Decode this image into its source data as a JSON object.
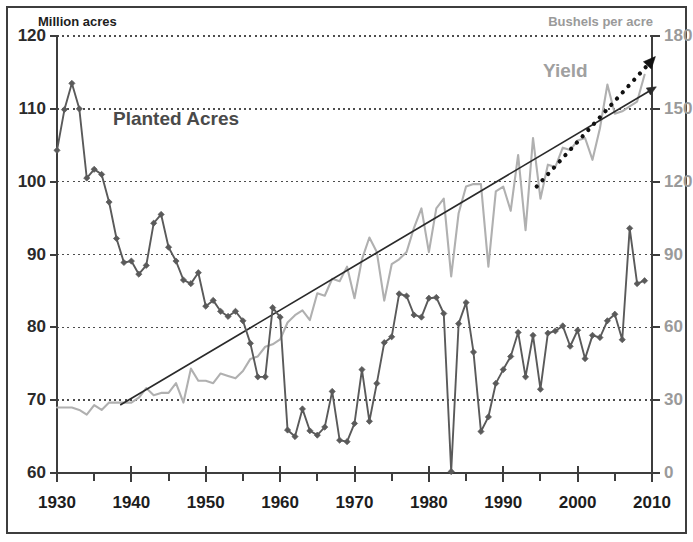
{
  "axes": {
    "left_title": "Million acres",
    "right_title": "Bushels per acre",
    "left_ticks": [
      "120",
      "110",
      "100",
      "90",
      "80",
      "70",
      "60"
    ],
    "right_ticks": [
      "180",
      "150",
      "120",
      "90",
      "60",
      "30",
      "0"
    ],
    "x_ticks": [
      "1930",
      "1940",
      "1950",
      "1960",
      "1970",
      "1980",
      "1990",
      "2000",
      "2010"
    ]
  },
  "labels": {
    "planted": "Planted Acres",
    "yield": "Yield"
  },
  "colors": {
    "planted": "#5a5a5a",
    "yield": "#b0b0b0",
    "trend": "#2a2a2a",
    "forecast": "#111111",
    "axis": "#3d3d3d",
    "grid": "#4d4d4d",
    "right_axis_text": "#9a9a9a"
  },
  "chart_data": {
    "type": "line",
    "title": "",
    "xlabel": "",
    "ylabel": "Million acres",
    "y2label": "Bushels per acre",
    "xlim": [
      1930,
      2010
    ],
    "ylim": [
      60,
      120
    ],
    "y2lim": [
      0,
      180
    ],
    "grid": true,
    "legend_position": "inline-annotation",
    "x": [
      1930,
      1931,
      1932,
      1933,
      1934,
      1935,
      1936,
      1937,
      1938,
      1939,
      1940,
      1941,
      1942,
      1943,
      1944,
      1945,
      1946,
      1947,
      1948,
      1949,
      1950,
      1951,
      1952,
      1953,
      1954,
      1955,
      1956,
      1957,
      1958,
      1959,
      1960,
      1961,
      1962,
      1963,
      1964,
      1965,
      1966,
      1967,
      1968,
      1969,
      1970,
      1971,
      1972,
      1973,
      1974,
      1975,
      1976,
      1977,
      1978,
      1979,
      1980,
      1981,
      1982,
      1983,
      1984,
      1985,
      1986,
      1987,
      1988,
      1989,
      1990,
      1991,
      1992,
      1993,
      1994,
      1995,
      1996,
      1997,
      1998,
      1999,
      2000,
      2001,
      2002,
      2003,
      2004,
      2005,
      2006,
      2007,
      2008,
      2009
    ],
    "series": [
      {
        "name": "Planted Acres",
        "axis": "left",
        "units": "million acres",
        "color": "#5a5a5a",
        "marker": "diamond",
        "values": [
          104.3,
          109.9,
          113.5,
          110.0,
          100.5,
          101.7,
          101.0,
          97.2,
          92.2,
          88.9,
          89.1,
          87.3,
          88.5,
          94.3,
          95.5,
          91.0,
          89.1,
          86.5,
          86.0,
          87.5,
          82.9,
          83.7,
          82.2,
          81.5,
          82.2,
          80.9,
          77.8,
          73.2,
          73.2,
          82.7,
          81.4,
          65.9,
          65.0,
          68.8,
          65.8,
          65.2,
          66.3,
          71.2,
          64.5,
          64.3,
          66.8,
          74.2,
          67.1,
          72.3,
          77.9,
          78.7,
          84.6,
          84.3,
          81.7,
          81.4,
          84.0,
          84.1,
          81.9,
          60.2,
          80.5,
          83.4,
          76.6,
          65.7,
          67.7,
          72.3,
          74.2,
          76.0,
          79.3,
          73.2,
          78.9,
          71.5,
          79.2,
          79.5,
          80.2,
          77.4,
          79.6,
          75.7,
          78.9,
          78.6,
          80.9,
          81.8,
          78.3,
          93.6,
          86.0,
          86.4
        ]
      },
      {
        "name": "Yield",
        "axis": "right",
        "units": "bushels per acre",
        "color": "#b0b0b0",
        "marker": "none",
        "values": [
          27.0,
          27.0,
          27.0,
          26.0,
          24.0,
          28.0,
          26.0,
          29.0,
          29.0,
          29.0,
          29.0,
          31.0,
          35.0,
          32.0,
          33.0,
          33.0,
          37.0,
          29.0,
          43.0,
          38.0,
          38.0,
          37.0,
          41.0,
          40.0,
          39.0,
          42.0,
          47.0,
          48.0,
          52.0,
          53.0,
          55.0,
          62.0,
          65.0,
          67.0,
          63.0,
          74.0,
          73.0,
          80.0,
          79.0,
          85.0,
          72.0,
          88.0,
          97.0,
          91.0,
          71.0,
          86.0,
          88.0,
          91.0,
          101.0,
          109.0,
          91.0,
          109.0,
          113.0,
          81.0,
          107.0,
          118.0,
          119.0,
          119.0,
          85.0,
          116.0,
          118.0,
          108.0,
          131.0,
          100.0,
          138.0,
          113.0,
          127.0,
          126.0,
          134.0,
          133.0,
          137.0,
          138.0,
          129.0,
          142.0,
          160.0,
          148.0,
          149.0,
          151.0,
          153.0,
          164.0
        ]
      }
    ],
    "annotations": [
      {
        "name": "yield_trend_line",
        "type": "line",
        "style": "solid",
        "arrow": true,
        "x_start": 1938.5,
        "y_start": 28,
        "x_end": 2010,
        "y_end": 158,
        "axis": "right"
      },
      {
        "name": "yield_forecast_line",
        "type": "line",
        "style": "dotted",
        "arrow": true,
        "x_start": 1994.5,
        "y_start": 118,
        "x_end": 2010,
        "y_end": 170,
        "axis": "right"
      }
    ]
  }
}
